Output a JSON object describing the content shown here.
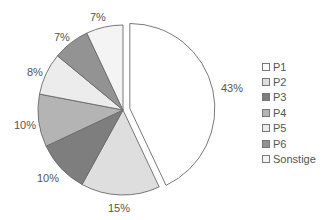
{
  "chart_data": {
    "type": "pie",
    "title": "",
    "categories": [
      "P1",
      "P2",
      "P3",
      "P4",
      "P5",
      "P6",
      "Sonstige"
    ],
    "values": [
      43,
      15,
      10,
      10,
      8,
      7,
      7
    ],
    "labels": [
      "43%",
      "15%",
      "10%",
      "10%",
      "8%",
      "7%",
      "7%"
    ],
    "colors": [
      "#ffffff",
      "#dedede",
      "#7e7e7e",
      "#b4b4b4",
      "#ececec",
      "#939393",
      "#f4f4f4"
    ],
    "exploded": [
      "P1"
    ],
    "start_angle": "12 o'clock",
    "direction": "clockwise",
    "legend_position": "right"
  },
  "legend": {
    "items": [
      {
        "label": "P1",
        "color": "#ffffff"
      },
      {
        "label": "P2",
        "color": "#dedede"
      },
      {
        "label": "P3",
        "color": "#7e7e7e"
      },
      {
        "label": "P4",
        "color": "#b4b4b4"
      },
      {
        "label": "P5",
        "color": "#ececec"
      },
      {
        "label": "P6",
        "color": "#939393"
      },
      {
        "label": "Sonstige",
        "color": "#f4f4f4"
      }
    ]
  },
  "slice_labels": [
    {
      "text": "43%",
      "x": 221,
      "y": 82
    },
    {
      "text": "15%",
      "x": 108,
      "y": 202
    },
    {
      "text": "10%",
      "x": 37,
      "y": 172
    },
    {
      "text": "10%",
      "x": 14,
      "y": 119
    },
    {
      "text": "8%",
      "x": 27,
      "y": 66
    },
    {
      "text": "7%",
      "x": 54,
      "y": 31
    },
    {
      "text": "7%",
      "x": 90,
      "y": 11
    }
  ]
}
